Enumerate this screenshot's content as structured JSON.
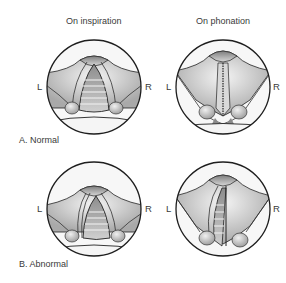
{
  "columns": [
    {
      "title": "On inspiration"
    },
    {
      "title": "On phonation"
    }
  ],
  "rows": [
    {
      "label": "A. Normal"
    },
    {
      "label": "B. Abnormal"
    }
  ],
  "sides": {
    "left": "L",
    "right": "R"
  },
  "colors": {
    "outline": "#1e1e1e",
    "tissue_light": "#f2f2f2",
    "tissue_mid": "#bdbdbd",
    "tissue_dark": "#7a7a7a",
    "background": "#ffffff"
  }
}
